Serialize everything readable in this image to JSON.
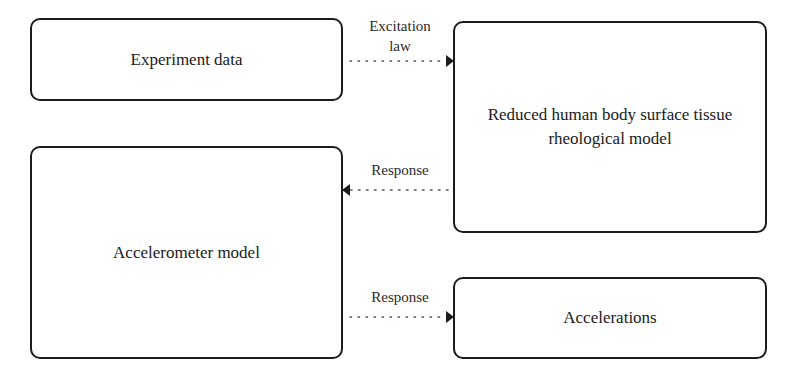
{
  "nodes": {
    "experiment_data": {
      "label": "Experiment data"
    },
    "reduced_model": {
      "label": "Reduced human body surface tissue rheological model"
    },
    "accelerometer_model": {
      "label": "Accelerometer model"
    },
    "accelerations": {
      "label": "Accelerations"
    }
  },
  "edges": [
    {
      "from": "experiment_data",
      "to": "reduced_model",
      "label_line1": "Excitation",
      "label_line2": "law",
      "style": "dotted"
    },
    {
      "from": "reduced_model",
      "to": "accelerometer_model",
      "label": "Response",
      "style": "dotted"
    },
    {
      "from": "accelerometer_model",
      "to": "accelerations",
      "label": "Response",
      "style": "dotted"
    }
  ],
  "colors": {
    "stroke": "#1c1c1c",
    "background": "#ffffff",
    "text": "#1a1a1a"
  }
}
